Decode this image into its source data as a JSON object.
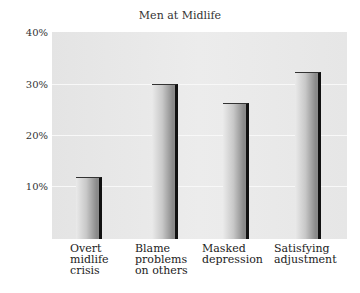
{
  "chart_data": {
    "type": "bar",
    "title": "Men at Midlife",
    "categories": [
      "Overt midlife crisis",
      "Blame problems on others",
      "Masked depression",
      "Satisfying adjustment"
    ],
    "category_lines": [
      [
        "Overt",
        "midlife",
        "crisis"
      ],
      [
        "Blame",
        "problems",
        "on others"
      ],
      [
        "Masked",
        "depression"
      ],
      [
        "Satisfying",
        "adjustment"
      ]
    ],
    "values": [
      12,
      30,
      26.5,
      32.5
    ],
    "xlabel": "",
    "ylabel": "",
    "ylim": [
      0,
      40
    ],
    "yticks": [
      "10%",
      "20%",
      "30%",
      "40%"
    ],
    "grid": true,
    "legend": null
  }
}
